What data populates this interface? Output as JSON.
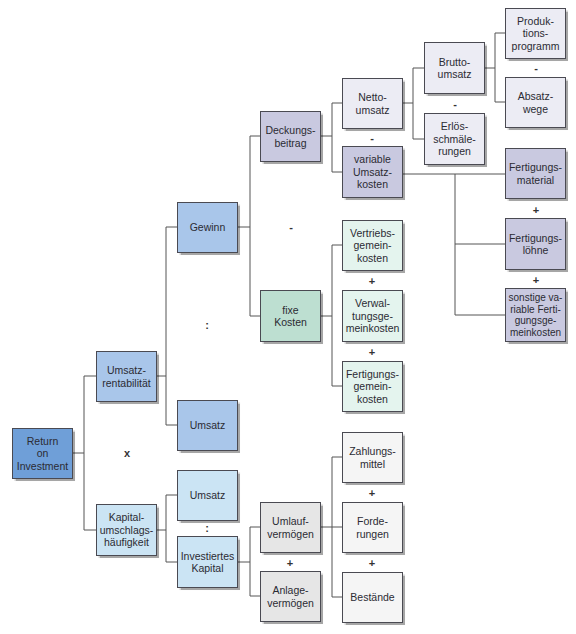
{
  "diagram": {
    "nodes": {
      "roi": "Return\non\nInvestment",
      "umsatzrentabilitaet": "Umsatz-\nrentabilität",
      "kapitalumschlag": "Kapital-\numschlags-\nhäufigkeit",
      "gewinn": "Gewinn",
      "umsatz_1": "Umsatz",
      "umsatz_2": "Umsatz",
      "investiertes_kapital": "Investiertes\nKapital",
      "deckungsbeitrag": "Deckungs-\nbeitrag",
      "fixe_kosten": "fixe\nKosten",
      "umlaufvermoegen": "Umlauf-\nvermögen",
      "anlagevermoegen": "Anlage-\nvermögen",
      "nettoumsatz": "Netto-\numsatz",
      "variable_umsatzkosten": "variable\nUmsatz-\nkosten",
      "vertriebsgemeinkosten": "Vertriebs-\ngemein-\nkosten",
      "verwaltungsgemeinkosten": "Verwal-\ntungsge-\nmeinkosten",
      "fertigungsgemeinkosten": "Fertigungs-\ngemein-\nkosten",
      "zahlungsmittel": "Zahlungs-\nmittel",
      "forderungen": "Forde-\nrungen",
      "bestaende": "Bestände",
      "bruttoumsatz": "Brutto-\numsatz",
      "erloesschmaelerungen": "Erlös-\nschmäle-\nrungen",
      "produktionsprogramm": "Produk-\ntions-\nprogramm",
      "absatzwege": "Absatz-\nwege",
      "fertigungsmaterial": "Fertigungs-\nmaterial",
      "fertigungsloehne": "Fertigungs-\nlöhne",
      "sonstige_fgk": "sonstige va-\nriable Ferti-\ngungsge-\nmeinkosten"
    },
    "operators": {
      "roi_mult": "x",
      "rentab_div": ":",
      "umschlag_div": ":",
      "gewinn_minus": "-",
      "db_minus": "-",
      "netto_minus": "-",
      "brutto_minus": "-",
      "fk_plus_1": "+",
      "fk_plus_2": "+",
      "vk_plus_1": "+",
      "vk_plus_2": "+",
      "kap_plus": "+",
      "uv_plus_1": "+",
      "uv_plus_2": "+"
    },
    "colors": {
      "roi": "#6f9fd8",
      "level_blue": "#a9c6ea",
      "capital_cyan": "#cbe4f4",
      "lavender": "#c9c9e0",
      "mint": "#bddfd1",
      "grey": "#e6e6e6"
    }
  }
}
